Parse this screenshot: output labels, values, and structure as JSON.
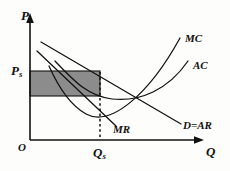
{
  "figure": {
    "type": "economics-diagram",
    "background_color": "#fdfdfb",
    "line_color": "#111111",
    "shade_color": "#8c8c8c"
  },
  "axes": {
    "y_label": "P",
    "x_label": "Q",
    "origin_label": "O",
    "y_tick_label": "P",
    "y_tick_sub": "s",
    "x_tick_label": "Q",
    "x_tick_sub": "s"
  },
  "curves": [
    {
      "id": "mc",
      "label": "MC",
      "shape": "u-shaped-rising"
    },
    {
      "id": "ac",
      "label": "AC",
      "shape": "u-shaped"
    },
    {
      "id": "demand",
      "label": "D=AR",
      "shape": "downward-line"
    },
    {
      "id": "mr",
      "label": "MR",
      "shape": "downward-line-steep"
    }
  ],
  "regions": [
    {
      "id": "profit-rectangle",
      "fill": "#8c8c8c",
      "stroke": "#111111"
    }
  ],
  "guides": [
    {
      "id": "quantity-dropline",
      "style": "dotted",
      "from": "Qs",
      "to": "price-level"
    }
  ]
}
